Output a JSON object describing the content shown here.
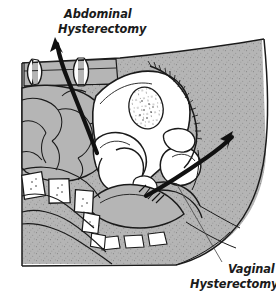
{
  "figure": {
    "view": "lateral cutaway",
    "background_color": "#ffffff",
    "line_color": "#1a1a1a",
    "tissue_fill_color": "#b5b5b5",
    "cavity_fill_color": "#ffffff",
    "stipple_color": "#4a4a4a"
  },
  "labels": {
    "abdominal": {
      "line1": "Abdominal",
      "line2": "Hysterectomy",
      "position": "top-left",
      "style": "bold-italic"
    },
    "vaginal": {
      "line1": "Vaginal",
      "line2": "Hysterectomy",
      "position": "bottom-right",
      "style": "bold-italic"
    }
  },
  "annotations": {
    "abdominal_arrow": {
      "name": "abdominal-approach-arrow",
      "description": "thick curved arrow sweeping up and left from the uterine fundus through the abdominal wall incision",
      "direction": "up-left",
      "head_at": [
        55,
        37
      ],
      "tail_at": [
        97,
        153
      ],
      "stroke_width": 4.2
    },
    "vaginal_arrow": {
      "name": "vaginal-approach-arrow",
      "description": "thick curved arrow sweeping up and right from the cervix out through the vaginal canal",
      "direction": "up-right",
      "head_at": [
        233,
        131
      ],
      "tail_at": [
        146,
        196
      ],
      "stroke_width": 4.0
    },
    "vaginal_leader": {
      "name": "vaginal-label-leader-line",
      "description": "thin leader line from the vaginal canal down-right to the Vaginal Hysterectomy caption",
      "from": [
        176,
        183
      ],
      "to": [
        222,
        262
      ],
      "stroke_width": 0.8
    }
  },
  "anatomy": [
    {
      "name": "abdominal-wall",
      "label": "Anterior abdominal wall",
      "fill": "tissue"
    },
    {
      "name": "abdominal-incision-retractors",
      "label": "Incision retractor marks",
      "fill": "cavity"
    },
    {
      "name": "small-intestine",
      "label": "Loops of small bowel",
      "fill": "tissue"
    },
    {
      "name": "uterus",
      "label": "Uterus",
      "fill": "cavity"
    },
    {
      "name": "uterine-cavity",
      "label": "Endometrial cavity",
      "fill": "cavity"
    },
    {
      "name": "bladder",
      "label": "Urinary bladder",
      "fill": "cavity"
    },
    {
      "name": "pubic-symphysis",
      "label": "Pubic symphysis",
      "fill": "cavity"
    },
    {
      "name": "vagina",
      "label": "Vagina",
      "fill": "cavity"
    },
    {
      "name": "cervix",
      "label": "Cervix",
      "fill": "cavity"
    },
    {
      "name": "rectum",
      "label": "Rectum",
      "fill": "tissue"
    },
    {
      "name": "sacral-vertebrae",
      "label": "Sacral vertebrae",
      "fill": "cavity"
    },
    {
      "name": "coccyx",
      "label": "Coccyx",
      "fill": "cavity"
    },
    {
      "name": "gluteal-soft-tissue",
      "label": "Gluteal soft tissue",
      "fill": "tissue"
    },
    {
      "name": "perineum",
      "label": "Perineum",
      "fill": "tissue"
    }
  ]
}
